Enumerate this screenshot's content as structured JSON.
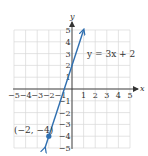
{
  "chart_data": {
    "type": "line",
    "title": "",
    "xlabel": "x",
    "ylabel": "y",
    "xlim": [
      -5,
      5
    ],
    "ylim": [
      -5,
      5
    ],
    "grid": true,
    "x_ticks": [
      -5,
      -4,
      -3,
      -2,
      -1,
      1,
      2,
      3,
      4,
      5
    ],
    "y_ticks": [
      -5,
      -4,
      -3,
      -2,
      -1,
      1,
      2,
      3,
      4,
      5
    ],
    "x_tick_labels": [
      "−5",
      "−4",
      "−3",
      "−2",
      "−1",
      "1",
      "2",
      "3",
      "4",
      "5"
    ],
    "y_tick_labels": [
      "−5",
      "−4",
      "−3",
      "−2",
      "−1",
      "1",
      "2",
      "3",
      "4",
      "5"
    ],
    "series": [
      {
        "name": "y = 3x + 2",
        "equation": "y = 3x + 2",
        "slope": 3,
        "intercept": 2,
        "x": [
          -2.33,
          1
        ],
        "y": [
          -5,
          5
        ],
        "arrows": "both",
        "color": "#2f6fb0"
      }
    ],
    "annotations": [
      {
        "text": "y = 3x + 2",
        "x": 1.5,
        "y": 3
      },
      {
        "text": "(−2, −4)",
        "point": [
          -2,
          -4
        ],
        "marked": true
      }
    ]
  },
  "labels": {
    "x_axis": "x",
    "y_axis": "y",
    "equation": "y = 3x + 2",
    "point": "(−2, −4)"
  },
  "colors": {
    "line": "#2f6fb0",
    "grid": "#d9d9d9",
    "axis": "#333333"
  }
}
